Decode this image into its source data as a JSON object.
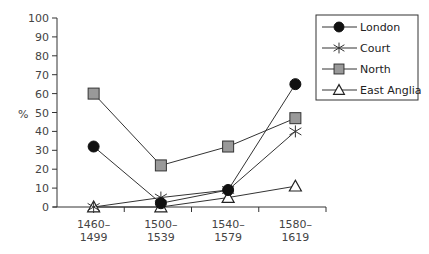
{
  "chart_data": {
    "type": "line",
    "title": "",
    "xlabel": "",
    "ylabel": "%",
    "ylim": [
      0,
      100
    ],
    "yticks": [
      0,
      10,
      20,
      30,
      40,
      50,
      60,
      70,
      80,
      90,
      100
    ],
    "grid": false,
    "legend_position": "top-right",
    "categories": [
      [
        "1460–",
        "1499"
      ],
      [
        "1500–",
        "1539"
      ],
      [
        "1540–",
        "1579"
      ],
      [
        "1580–",
        "1619"
      ]
    ],
    "series": [
      {
        "name": "London",
        "marker": "filled-circle",
        "color": "#111111",
        "values": [
          32,
          2,
          9,
          65
        ]
      },
      {
        "name": "Court",
        "marker": "asterisk",
        "color": "#333333",
        "values": [
          0,
          5,
          9,
          40
        ]
      },
      {
        "name": "North",
        "marker": "grey-square",
        "color": "#999999",
        "values": [
          60,
          22,
          32,
          47
        ]
      },
      {
        "name": "East Anglia",
        "marker": "open-triangle",
        "color": "#ffffff",
        "values": [
          0,
          0,
          5,
          11
        ]
      }
    ]
  }
}
